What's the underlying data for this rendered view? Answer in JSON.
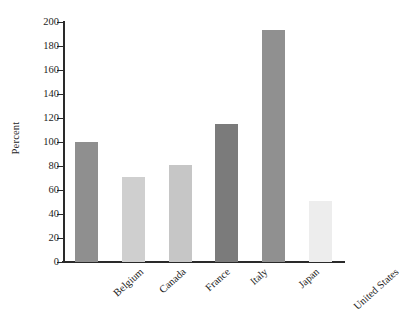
{
  "chart_data": {
    "type": "bar",
    "title": "",
    "subtitle": "",
    "xlabel": "",
    "ylabel": "Percent",
    "categories": [
      "Belgium",
      "Canada",
      "France",
      "Italy",
      "Japan",
      "United States"
    ],
    "values": [
      100,
      71,
      81,
      115,
      193,
      51
    ],
    "bar_colors": [
      "#8f8f8f",
      "#cfcfcf",
      "#c6c6c6",
      "#7b7b7b",
      "#909090",
      "#ededed"
    ],
    "ylim": [
      0,
      200
    ],
    "ytick_step": 20,
    "yticks": [
      0,
      20,
      40,
      60,
      80,
      100,
      120,
      140,
      160,
      180,
      200
    ],
    "ytick_labels": [
      "0",
      "20",
      "40",
      "60",
      "80",
      "100",
      "120",
      "140",
      "160",
      "180",
      "200"
    ],
    "grid": false,
    "legend": "none",
    "axis_color": "#2a2a2a",
    "background_color": "#ffffff",
    "label_rotation_deg": -42
  }
}
